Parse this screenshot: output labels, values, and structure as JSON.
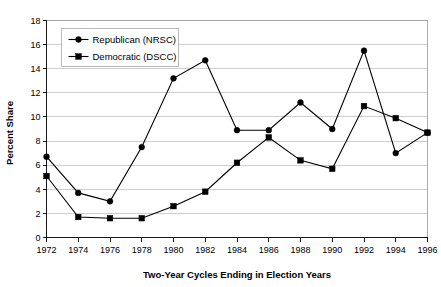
{
  "chart_data": {
    "type": "line",
    "title": "",
    "xlabel": "Two-Year Cycles Ending in Election Years",
    "ylabel": "Percent Share",
    "x": [
      1972,
      1974,
      1976,
      1978,
      1980,
      1982,
      1984,
      1986,
      1988,
      1990,
      1992,
      1994,
      1996
    ],
    "xtick_labels": [
      "1972",
      "1974",
      "1976",
      "1978",
      "1980",
      "1982",
      "1984",
      "1986",
      "1988",
      "1990",
      "1992",
      "1994",
      "1996"
    ],
    "ytick_labels": [
      "0",
      "2",
      "4",
      "6",
      "8",
      "10",
      "12",
      "14",
      "16",
      "18"
    ],
    "ytick_values": [
      0,
      2,
      4,
      6,
      8,
      10,
      12,
      14,
      16,
      18
    ],
    "ylim": [
      0,
      18
    ],
    "xlim": [
      1972,
      1996
    ],
    "grid": "horizontal",
    "legend_position": "upper-left-inside",
    "series": [
      {
        "name": "Republican (NRSC)",
        "marker": "circle",
        "color": "#000000",
        "values": [
          6.7,
          3.7,
          3.0,
          7.5,
          13.2,
          14.7,
          8.9,
          8.9,
          11.2,
          9.0,
          15.5,
          7.0,
          8.7
        ]
      },
      {
        "name": "Democratic (DSCC)",
        "marker": "square",
        "color": "#000000",
        "values": [
          5.1,
          1.7,
          1.6,
          1.6,
          2.6,
          3.8,
          6.2,
          8.3,
          6.4,
          5.7,
          10.9,
          9.9,
          8.7
        ]
      }
    ]
  },
  "legend": {
    "entries": [
      {
        "label": "Republican (NRSC)",
        "marker": "circle"
      },
      {
        "label": "Democratic (DSCC)",
        "marker": "square"
      }
    ]
  },
  "colors": {
    "background": "#ffffff",
    "gridline": "#b9b9b9",
    "axis": "#000000",
    "series": "#000000"
  }
}
